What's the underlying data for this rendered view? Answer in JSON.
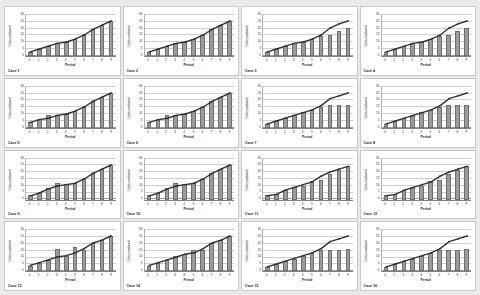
{
  "figure": {
    "background_color": "#eaeaea",
    "panel_background": "#ffffff",
    "panel_border_color": "#c9c9c9",
    "rows": 4,
    "columns": 4,
    "panel_count": 16
  },
  "style": {
    "bar_color": "#9b9b9b",
    "bar_edge_color": "#6f6f6f",
    "line_color": "#333333",
    "marker_color": "#333333",
    "gridline_color": "#ccd0d4",
    "axis_color": "#808080"
  },
  "chart_data": [
    {
      "type": "bar",
      "title": "Case 1",
      "xlabel": "Period",
      "ylabel": "Units produced",
      "categories": [
        "0",
        "1",
        "2",
        "3",
        "4",
        "5",
        "6",
        "7",
        "8",
        "9"
      ],
      "yticks": [
        "30",
        "25",
        "20",
        "15",
        "10",
        "5",
        "0"
      ],
      "ylim": [
        0,
        30
      ],
      "grid": true,
      "legend": "none",
      "series": [
        {
          "name": "Units produced (bars)",
          "type": "bar",
          "values": [
            3,
            5,
            7,
            9,
            10,
            12,
            15,
            19,
            22,
            25
          ]
        },
        {
          "name": "Cumulative trend (line)",
          "type": "line",
          "values": [
            3,
            5,
            7,
            9,
            10,
            12,
            15,
            19,
            22,
            25
          ]
        }
      ]
    },
    {
      "type": "bar",
      "title": "Case 2",
      "xlabel": "Period",
      "ylabel": "Units produced",
      "categories": [
        "0",
        "1",
        "2",
        "3",
        "4",
        "5",
        "6",
        "7",
        "8",
        "9"
      ],
      "yticks": [
        "30",
        "25",
        "20",
        "15",
        "10",
        "5",
        "0"
      ],
      "ylim": [
        0,
        30
      ],
      "grid": true,
      "legend": "none",
      "series": [
        {
          "name": "Units produced (bars)",
          "type": "bar",
          "values": [
            3,
            5,
            7,
            9,
            10,
            12,
            15,
            19,
            22,
            25
          ]
        },
        {
          "name": "Cumulative trend (line)",
          "type": "line",
          "values": [
            3,
            5,
            7,
            9,
            10,
            12,
            15,
            19,
            22,
            25
          ]
        }
      ]
    },
    {
      "type": "bar",
      "title": "Case 3",
      "xlabel": "Period",
      "ylabel": "Units produced",
      "categories": [
        "0",
        "1",
        "2",
        "3",
        "4",
        "5",
        "6",
        "7",
        "8",
        "9"
      ],
      "yticks": [
        "30",
        "25",
        "20",
        "15",
        "10",
        "5",
        "0"
      ],
      "ylim": [
        0,
        30
      ],
      "grid": true,
      "legend": "none",
      "series": [
        {
          "name": "Units produced (bars)",
          "type": "bar",
          "values": [
            3,
            5,
            7,
            9,
            10,
            12,
            14,
            15,
            18,
            20
          ]
        },
        {
          "name": "Cumulative trend (line)",
          "type": "line",
          "values": [
            3,
            5,
            7,
            9,
            10,
            12,
            15,
            20,
            23,
            25
          ]
        }
      ]
    },
    {
      "type": "bar",
      "title": "Case 4",
      "xlabel": "Period",
      "ylabel": "Units produced",
      "categories": [
        "0",
        "1",
        "2",
        "3",
        "4",
        "5",
        "6",
        "7",
        "8",
        "9"
      ],
      "yticks": [
        "30",
        "25",
        "20",
        "15",
        "10",
        "5",
        "0"
      ],
      "ylim": [
        0,
        30
      ],
      "grid": true,
      "legend": "none",
      "series": [
        {
          "name": "Units produced (bars)",
          "type": "bar",
          "values": [
            3,
            5,
            7,
            9,
            10,
            12,
            14,
            15,
            18,
            20
          ]
        },
        {
          "name": "Cumulative trend (line)",
          "type": "line",
          "values": [
            3,
            5,
            7,
            9,
            10,
            12,
            15,
            20,
            23,
            25
          ]
        }
      ]
    },
    {
      "type": "bar",
      "title": "Case 5",
      "xlabel": "Period",
      "ylabel": "Units produced",
      "categories": [
        "0",
        "1",
        "2",
        "3",
        "4",
        "5",
        "6",
        "7",
        "8",
        "9"
      ],
      "yticks": [
        "30",
        "25",
        "20",
        "15",
        "10",
        "5",
        "0"
      ],
      "ylim": [
        0,
        30
      ],
      "grid": true,
      "legend": "none",
      "series": [
        {
          "name": "Units produced (bars)",
          "type": "bar",
          "values": [
            4,
            6,
            9,
            9,
            10,
            12,
            15,
            19,
            22,
            25
          ]
        },
        {
          "name": "Cumulative trend (line)",
          "type": "line",
          "values": [
            4,
            6,
            7,
            9,
            10,
            12,
            15,
            19,
            22,
            25
          ]
        }
      ]
    },
    {
      "type": "bar",
      "title": "Case 6",
      "xlabel": "Period",
      "ylabel": "Units produced",
      "categories": [
        "0",
        "1",
        "2",
        "3",
        "4",
        "5",
        "6",
        "7",
        "8",
        "9"
      ],
      "yticks": [
        "30",
        "25",
        "20",
        "15",
        "10",
        "5",
        "0"
      ],
      "ylim": [
        0,
        30
      ],
      "grid": true,
      "legend": "none",
      "series": [
        {
          "name": "Units produced (bars)",
          "type": "bar",
          "values": [
            4,
            6,
            9,
            9,
            10,
            12,
            15,
            19,
            22,
            25
          ]
        },
        {
          "name": "Cumulative trend (line)",
          "type": "line",
          "values": [
            4,
            6,
            7,
            9,
            10,
            12,
            15,
            19,
            22,
            25
          ]
        }
      ]
    },
    {
      "type": "bar",
      "title": "Case 7",
      "xlabel": "Period",
      "ylabel": "Units produced",
      "categories": [
        "0",
        "1",
        "2",
        "3",
        "4",
        "5",
        "6",
        "7",
        "8",
        "9"
      ],
      "yticks": [
        "30",
        "25",
        "20",
        "15",
        "10",
        "5",
        "0"
      ],
      "ylim": [
        0,
        30
      ],
      "grid": true,
      "legend": "none",
      "series": [
        {
          "name": "Units produced (bars)",
          "type": "bar",
          "values": [
            3,
            5,
            7,
            9,
            11,
            13,
            15,
            16,
            16,
            16
          ]
        },
        {
          "name": "Cumulative trend (line)",
          "type": "line",
          "values": [
            3,
            5,
            7,
            9,
            11,
            13,
            16,
            21,
            23,
            25
          ]
        }
      ]
    },
    {
      "type": "bar",
      "title": "Case 8",
      "xlabel": "Period",
      "ylabel": "Units produced",
      "categories": [
        "0",
        "1",
        "2",
        "3",
        "4",
        "5",
        "6",
        "7",
        "8",
        "9"
      ],
      "yticks": [
        "30",
        "25",
        "20",
        "15",
        "10",
        "5",
        "0"
      ],
      "ylim": [
        0,
        30
      ],
      "grid": true,
      "legend": "none",
      "series": [
        {
          "name": "Units produced (bars)",
          "type": "bar",
          "values": [
            3,
            5,
            7,
            9,
            11,
            13,
            15,
            16,
            16,
            16
          ]
        },
        {
          "name": "Cumulative trend (line)",
          "type": "line",
          "values": [
            3,
            5,
            7,
            9,
            11,
            13,
            16,
            21,
            23,
            25
          ]
        }
      ]
    },
    {
      "type": "bar",
      "title": "Case 9",
      "xlabel": "Period",
      "ylabel": "Units produced",
      "categories": [
        "0",
        "1",
        "2",
        "3",
        "4",
        "5",
        "6",
        "7",
        "8",
        "9"
      ],
      "yticks": [
        "30",
        "25",
        "20",
        "15",
        "10",
        "5",
        "0"
      ],
      "ylim": [
        0,
        30
      ],
      "grid": true,
      "legend": "none",
      "series": [
        {
          "name": "Units produced (bars)",
          "type": "bar",
          "values": [
            3,
            5,
            8,
            12,
            11,
            12,
            15,
            19,
            22,
            25
          ]
        },
        {
          "name": "Cumulative trend (line)",
          "type": "line",
          "values": [
            3,
            5,
            8,
            10,
            11,
            12,
            15,
            19,
            22,
            25
          ]
        }
      ]
    },
    {
      "type": "bar",
      "title": "Case 10",
      "xlabel": "Period",
      "ylabel": "Units produced",
      "categories": [
        "0",
        "1",
        "2",
        "3",
        "4",
        "5",
        "6",
        "7",
        "8",
        "9"
      ],
      "yticks": [
        "30",
        "25",
        "20",
        "15",
        "10",
        "5",
        "0"
      ],
      "ylim": [
        0,
        30
      ],
      "grid": true,
      "legend": "none",
      "series": [
        {
          "name": "Units produced (bars)",
          "type": "bar",
          "values": [
            3,
            5,
            8,
            12,
            11,
            12,
            15,
            19,
            22,
            25
          ]
        },
        {
          "name": "Cumulative trend (line)",
          "type": "line",
          "values": [
            3,
            5,
            8,
            10,
            11,
            12,
            15,
            19,
            22,
            25
          ]
        }
      ]
    },
    {
      "type": "bar",
      "title": "Case 11",
      "xlabel": "Period",
      "ylabel": "Units produced",
      "categories": [
        "0",
        "1",
        "2",
        "3",
        "4",
        "5",
        "6",
        "7",
        "8",
        "9"
      ],
      "yticks": [
        "30",
        "25",
        "20",
        "15",
        "10",
        "5",
        "0"
      ],
      "ylim": [
        0,
        30
      ],
      "grid": true,
      "legend": "none",
      "series": [
        {
          "name": "Units produced (bars)",
          "type": "bar",
          "values": [
            3,
            4,
            7,
            9,
            10,
            13,
            14,
            18,
            21,
            24
          ]
        },
        {
          "name": "Cumulative trend (line)",
          "type": "line",
          "values": [
            3,
            4,
            7,
            9,
            11,
            13,
            17,
            20,
            22,
            24
          ]
        }
      ]
    },
    {
      "type": "bar",
      "title": "Case 12",
      "xlabel": "Period",
      "ylabel": "Units produced",
      "categories": [
        "0",
        "1",
        "2",
        "3",
        "4",
        "5",
        "6",
        "7",
        "8",
        "9"
      ],
      "yticks": [
        "30",
        "25",
        "20",
        "15",
        "10",
        "5",
        "0"
      ],
      "ylim": [
        0,
        30
      ],
      "grid": true,
      "legend": "none",
      "series": [
        {
          "name": "Units produced (bars)",
          "type": "bar",
          "values": [
            3,
            4,
            7,
            9,
            10,
            13,
            14,
            18,
            21,
            24
          ]
        },
        {
          "name": "Cumulative trend (line)",
          "type": "line",
          "values": [
            3,
            4,
            7,
            9,
            11,
            13,
            17,
            20,
            22,
            24
          ]
        }
      ]
    },
    {
      "type": "bar",
      "title": "Case 13",
      "xlabel": "Period",
      "ylabel": "Units produced",
      "categories": [
        "0",
        "1",
        "2",
        "3",
        "4",
        "5",
        "6",
        "7",
        "8",
        "9"
      ],
      "yticks": [
        "30",
        "25",
        "20",
        "15",
        "10",
        "5",
        "0"
      ],
      "ylim": [
        0,
        30
      ],
      "grid": true,
      "legend": "none",
      "series": [
        {
          "name": "Units produced (bars)",
          "type": "bar",
          "values": [
            4,
            6,
            8,
            16,
            11,
            17,
            15,
            20,
            22,
            25
          ]
        },
        {
          "name": "Cumulative trend (line)",
          "type": "line",
          "values": [
            4,
            6,
            8,
            10,
            11,
            13,
            16,
            20,
            22,
            25
          ]
        }
      ]
    },
    {
      "type": "bar",
      "title": "Case 14",
      "xlabel": "Period",
      "ylabel": "Units produced",
      "categories": [
        "0",
        "1",
        "2",
        "3",
        "4",
        "5",
        "6",
        "7",
        "8",
        "9"
      ],
      "yticks": [
        "30",
        "25",
        "20",
        "15",
        "10",
        "5",
        "0"
      ],
      "ylim": [
        0,
        30
      ],
      "grid": true,
      "legend": "none",
      "series": [
        {
          "name": "Units produced (bars)",
          "type": "bar",
          "values": [
            4,
            6,
            8,
            11,
            12,
            15,
            15,
            20,
            22,
            25
          ]
        },
        {
          "name": "Cumulative trend (line)",
          "type": "line",
          "values": [
            4,
            6,
            8,
            10,
            12,
            13,
            16,
            20,
            22,
            25
          ]
        }
      ]
    },
    {
      "type": "bar",
      "title": "Case 15",
      "xlabel": "Period",
      "ylabel": "Units produced",
      "categories": [
        "0",
        "1",
        "2",
        "3",
        "4",
        "5",
        "6",
        "7",
        "8",
        "9"
      ],
      "yticks": [
        "30",
        "25",
        "20",
        "15",
        "10",
        "5",
        "0"
      ],
      "ylim": [
        0,
        30
      ],
      "grid": true,
      "legend": "none",
      "series": [
        {
          "name": "Units produced (bars)",
          "type": "bar",
          "values": [
            3,
            5,
            7,
            9,
            11,
            13,
            15,
            15,
            15,
            16
          ]
        },
        {
          "name": "Cumulative trend (line)",
          "type": "line",
          "values": [
            3,
            5,
            7,
            9,
            11,
            13,
            16,
            21,
            23,
            25
          ]
        }
      ]
    },
    {
      "type": "bar",
      "title": "Case 16",
      "xlabel": "Period",
      "ylabel": "Units produced",
      "categories": [
        "0",
        "1",
        "2",
        "3",
        "4",
        "5",
        "6",
        "7",
        "8",
        "9"
      ],
      "yticks": [
        "30",
        "25",
        "20",
        "15",
        "10",
        "5",
        "0"
      ],
      "ylim": [
        0,
        30
      ],
      "grid": true,
      "legend": "none",
      "series": [
        {
          "name": "Units produced (bars)",
          "type": "bar",
          "values": [
            3,
            5,
            7,
            9,
            11,
            13,
            15,
            15,
            15,
            16
          ]
        },
        {
          "name": "Cumulative trend (line)",
          "type": "line",
          "values": [
            3,
            5,
            7,
            9,
            11,
            13,
            16,
            21,
            23,
            25
          ]
        }
      ]
    }
  ]
}
